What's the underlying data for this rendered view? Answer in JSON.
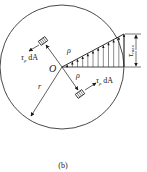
{
  "figure": {
    "caption": "(b)",
    "center_label": "O",
    "radius_label": "r",
    "rho_label_upper": "ρ",
    "rho_label_lower": "ρ",
    "element_force_label_upper": {
      "main": "τ",
      "sub": "ρ",
      "rest": " dA"
    },
    "element_force_label_lower": {
      "main": "τ",
      "sub": "ρ",
      "rest": " dA"
    },
    "max_stress_label": {
      "main": "τ",
      "sub": "max"
    },
    "stroke_color": "#1a1a1a"
  }
}
